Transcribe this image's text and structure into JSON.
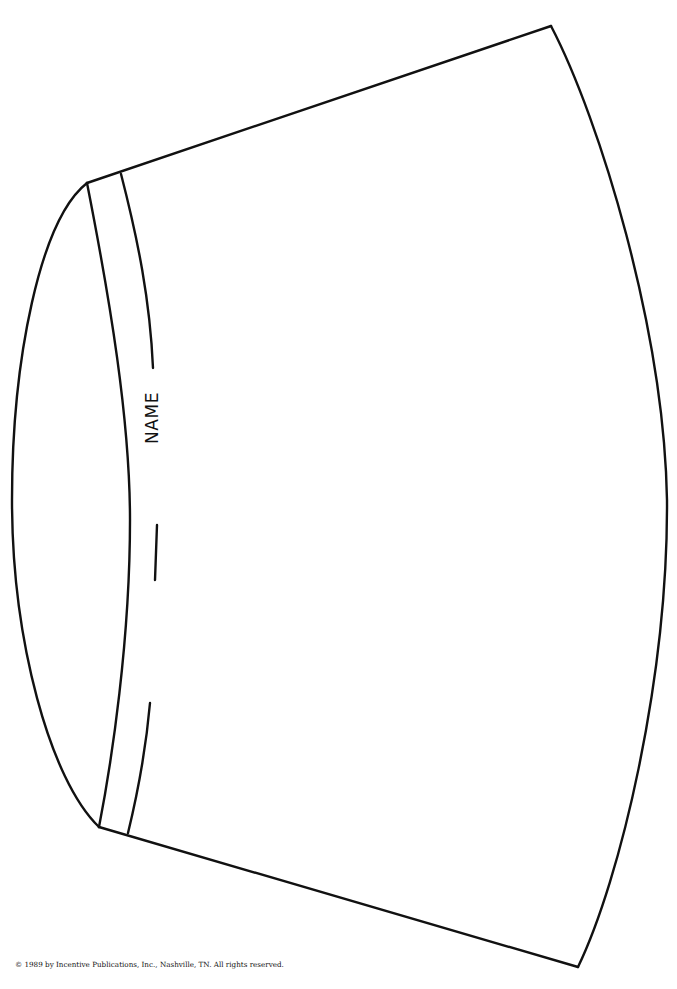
{
  "template": {
    "label": "NAME",
    "copyright": "© 1989 by Incentive Publications, Inc., Nashville, TN. All rights reserved.",
    "stroke_color": "#111111",
    "background_color": "#ffffff"
  }
}
